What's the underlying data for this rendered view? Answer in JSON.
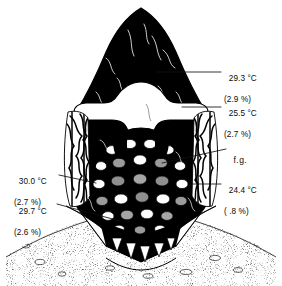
{
  "figure": {
    "kind": "scientific-line-drawing",
    "technique": "stippled halftone ink illustration, black and white",
    "colors": {
      "ink": "#000000",
      "paper": "#ffffff",
      "midtone_gray": "#8d8d8d",
      "light_gray": "#c9c9c9",
      "leader_line": "#1a1a1a"
    }
  },
  "annotations": [
    {
      "id": "top-right",
      "temperature": "29.3 °C",
      "percent": "(2.9 %)",
      "side": "right",
      "label_x": 224,
      "label_y": 64,
      "leader": {
        "x1": 157,
        "y1": 72,
        "x2": 221,
        "y2": 72
      }
    },
    {
      "id": "upper-right",
      "temperature": "25.5 °C",
      "percent": "(2.7 %)",
      "side": "right",
      "label_x": 224,
      "label_y": 99,
      "leader": {
        "x1": 182,
        "y1": 107,
        "x2": 221,
        "y2": 107
      }
    },
    {
      "id": "fg",
      "temperature": "f.g.",
      "percent": "",
      "side": "right",
      "label_x": 228,
      "label_y": 145,
      "leader": {
        "x1": 162,
        "y1": 163,
        "x2": 226,
        "y2": 149
      }
    },
    {
      "id": "lower-right",
      "temperature": "24.4 °C",
      "percent": "( .8 %)",
      "side": "right",
      "label_x": 224,
      "label_y": 176,
      "leader": {
        "x1": 192,
        "y1": 184,
        "x2": 221,
        "y2": 184
      }
    },
    {
      "id": "mid-left",
      "temperature": "30.0 °C",
      "percent": "(2.7 %)",
      "side": "left",
      "label_x": 14,
      "label_y": 167,
      "leader": {
        "x1": 59,
        "y1": 175,
        "x2": 96,
        "y2": 183
      }
    },
    {
      "id": "lower-left",
      "temperature": "29.7 °C",
      "percent": "(2.6 %)",
      "side": "left",
      "label_x": 14,
      "label_y": 197,
      "leader": {
        "x1": 57,
        "y1": 204,
        "x2": 120,
        "y2": 221
      }
    }
  ],
  "legend_note": {
    "fg_meaning": "f.g."
  }
}
